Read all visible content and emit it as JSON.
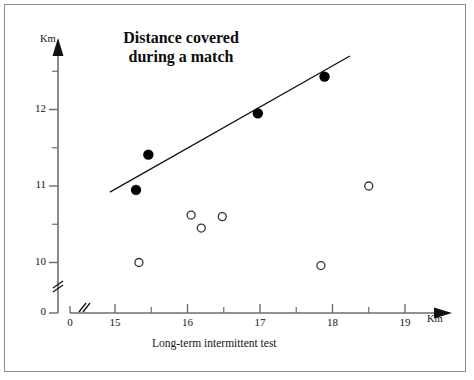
{
  "chart_data": {
    "type": "scatter",
    "title": "Distance covered during a match",
    "title_lines": [
      "Distance covered",
      "during a match"
    ],
    "xlabel": "Long-term intermittent test",
    "ylabel": "",
    "x_unit": "Km",
    "y_unit": "Km",
    "xlim": [
      14.46,
      19.42
    ],
    "ylim": [
      9.62,
      12.72
    ],
    "x_axis_break": true,
    "y_axis_break": true,
    "grid": false,
    "legend": null,
    "x_ticks": [
      {
        "value": 0,
        "label": "0",
        "major": true
      },
      {
        "value": 15,
        "label": "15",
        "major": true
      },
      {
        "value": 15.5,
        "label": "",
        "major": false
      },
      {
        "value": 16,
        "label": "16",
        "major": true
      },
      {
        "value": 16.5,
        "label": "",
        "major": false
      },
      {
        "value": 17,
        "label": "17",
        "major": true
      },
      {
        "value": 17.5,
        "label": "",
        "major": false
      },
      {
        "value": 18,
        "label": "18",
        "major": true
      },
      {
        "value": 18.5,
        "label": "",
        "major": false
      },
      {
        "value": 19,
        "label": "19",
        "major": true
      }
    ],
    "y_ticks": [
      {
        "value": 0,
        "label": "0",
        "major": true
      },
      {
        "value": 10,
        "label": "10",
        "major": true
      },
      {
        "value": 10.5,
        "label": "",
        "major": false
      },
      {
        "value": 11,
        "label": "11",
        "major": true
      },
      {
        "value": 11.5,
        "label": "",
        "major": false
      },
      {
        "value": 12,
        "label": "12",
        "major": true
      },
      {
        "value": 12.5,
        "label": "",
        "major": false
      }
    ],
    "series": [
      {
        "name": "filled",
        "marker": "filled-circle",
        "color": "#000000",
        "points": [
          {
            "x": 15.29,
            "y": 10.95
          },
          {
            "x": 15.46,
            "y": 11.41
          },
          {
            "x": 16.97,
            "y": 11.95
          },
          {
            "x": 17.89,
            "y": 12.43
          }
        ]
      },
      {
        "name": "open",
        "marker": "open-circle",
        "color": "#333333",
        "points": [
          {
            "x": 15.33,
            "y": 10.0
          },
          {
            "x": 16.05,
            "y": 10.62
          },
          {
            "x": 16.19,
            "y": 10.45
          },
          {
            "x": 16.48,
            "y": 10.6
          },
          {
            "x": 17.84,
            "y": 9.96
          },
          {
            "x": 18.5,
            "y": 11.0
          }
        ]
      }
    ],
    "trendline": {
      "name": "regression-line",
      "color": "#111111",
      "x_start": 14.93,
      "y_start": 10.92,
      "x_end": 18.24,
      "y_end": 12.7
    }
  }
}
